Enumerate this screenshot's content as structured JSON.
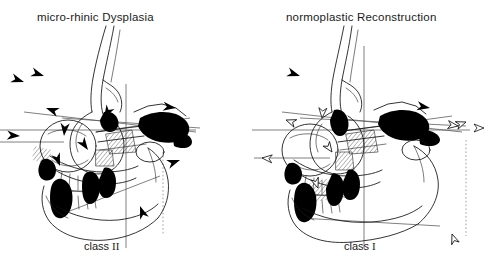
{
  "figure": {
    "kind": "cephalometric-tracing-comparison",
    "background_color": "#ffffff",
    "ink_color": "#000000",
    "reference_line_color": "#555555",
    "panel_count": 2
  },
  "panels": [
    {
      "id": "left",
      "title": "micro-rhinic Dysplasia",
      "class_label_prefix": "class",
      "class_label_numeral": "II",
      "arrow_style": "solid-filled",
      "arrow_count": 11,
      "description": "Lateral cephalometric tracing of a micro-rhinic dysplastic craniofacial skeleton with skeletal class II relationship, annotated with solid black vector arrows indicating deficient growth directions.",
      "arrows": [
        {
          "name": "nasion-region-arrow",
          "x": 40,
          "y": 76,
          "angle": 18,
          "size": 13
        },
        {
          "name": "glabella-arrow",
          "x": 54,
          "y": 108,
          "angle": 200,
          "size": 12
        },
        {
          "name": "orbital-superior-arrow",
          "x": 62,
          "y": 131,
          "angle": 95,
          "size": 11
        },
        {
          "name": "maxilla-posterior-arrow",
          "x": 100,
          "y": 115,
          "angle": 120,
          "size": 13
        },
        {
          "name": "nasal-floor-arrow",
          "x": 88,
          "y": 143,
          "angle": 55,
          "size": 11
        },
        {
          "name": "zygoma-arrow",
          "x": 150,
          "y": 112,
          "angle": 10,
          "size": 14
        },
        {
          "name": "ramus-arrow",
          "x": 176,
          "y": 124,
          "angle": 8,
          "size": 13
        },
        {
          "name": "gonion-arrow",
          "x": 176,
          "y": 158,
          "angle": 340,
          "size": 12
        },
        {
          "name": "condyle-arrow",
          "x": 140,
          "y": 200,
          "angle": 250,
          "size": 11
        },
        {
          "name": "orbital-left-arrow",
          "x": 22,
          "y": 132,
          "angle": 5,
          "size": 12
        },
        {
          "name": "symphysis-arrow",
          "x": 63,
          "y": 160,
          "angle": 70,
          "size": 11
        }
      ]
    },
    {
      "id": "right",
      "title": "normoplastic Reconstruction",
      "class_label_prefix": "class",
      "class_label_numeral": "I",
      "arrow_style": "hollow-outlined",
      "arrow_count": 11,
      "description": "Lateral cephalometric tracing after normoplastic reconstruction showing a skeletal class I relationship, annotated with small hollow outlined arrows indicating corrected, balanced growth vectors.",
      "arrows": [
        {
          "name": "nasion-region-arrow",
          "x": 296,
          "y": 76,
          "angle": 18,
          "size": 12,
          "filled": true
        },
        {
          "name": "glabella-arrow",
          "x": 290,
          "y": 113,
          "angle": 200,
          "size": 9
        },
        {
          "name": "orbital-superior-arrow",
          "x": 315,
          "y": 112,
          "angle": 95,
          "size": 9
        },
        {
          "name": "maxilla-posterior-arrow",
          "x": 290,
          "y": 158,
          "angle": 185,
          "size": 10
        },
        {
          "name": "nasal-floor-arrow",
          "x": 325,
          "y": 145,
          "angle": 55,
          "size": 9
        },
        {
          "name": "zygoma-arrow",
          "x": 420,
          "y": 108,
          "angle": 10,
          "size": 14,
          "filled": true
        },
        {
          "name": "ramus-arrow",
          "x": 452,
          "y": 123,
          "angle": 8,
          "size": 11
        },
        {
          "name": "gonion-arrow",
          "x": 470,
          "y": 118,
          "angle": 340,
          "size": 10
        },
        {
          "name": "condyle-arrow",
          "x": 404,
          "y": 204,
          "angle": 250,
          "size": 11
        },
        {
          "name": "orbital-left-arrow",
          "x": 270,
          "y": 158,
          "angle": 185,
          "size": 11
        },
        {
          "name": "symphysis-arrow",
          "x": 318,
          "y": 182,
          "angle": 70,
          "size": 9
        }
      ]
    }
  ],
  "reference_lines": {
    "left": {
      "frankfort_horizontal": true,
      "vertical_perpendicular": true,
      "nasion_line": true,
      "dashed_vertical": true,
      "occlusal_plane": true
    },
    "right": {
      "frankfort_horizontal": true,
      "vertical_perpendicular": true,
      "nasion_line": true,
      "dashed_vertical": true,
      "occlusal_plane": true
    }
  }
}
